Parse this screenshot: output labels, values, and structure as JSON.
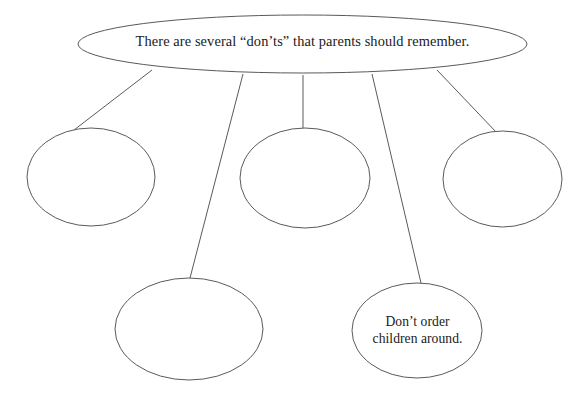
{
  "diagram": {
    "type": "web-graphic-organizer",
    "title_node": {
      "id": "main-idea",
      "text": "There are several “don’ts” that parents should remember.",
      "shape": "ellipse",
      "cx": 302.5,
      "cy": 44,
      "rx": 224.5,
      "ry": 29
    },
    "detail_nodes": [
      {
        "id": "detail-1",
        "label": "",
        "shape": "ellipse",
        "cx": 91,
        "cy": 177,
        "rx": 64,
        "ry": 49,
        "empty": true
      },
      {
        "id": "detail-2",
        "label": "",
        "shape": "ellipse",
        "cx": 189,
        "cy": 329,
        "rx": 74,
        "ry": 51,
        "empty": true
      },
      {
        "id": "detail-3",
        "label": "",
        "shape": "ellipse",
        "cx": 305,
        "cy": 178,
        "rx": 65,
        "ry": 50,
        "empty": true
      },
      {
        "id": "detail-4",
        "label": "Don’t order\nchildren around.",
        "shape": "ellipse",
        "cx": 417,
        "cy": 330.5,
        "rx": 65,
        "ry": 47.5,
        "empty": false
      },
      {
        "id": "detail-5",
        "label": "",
        "shape": "ellipse",
        "cx": 502.5,
        "cy": 179,
        "rx": 59.5,
        "ry": 48,
        "empty": true
      }
    ],
    "connectors": [
      {
        "id": "connector-1",
        "from": "main-idea",
        "to": "detail-1",
        "x1": 152,
        "y1": 70,
        "x2": 74,
        "y2": 130
      },
      {
        "id": "connector-2",
        "from": "main-idea",
        "to": "detail-2",
        "x1": 243,
        "y1": 74,
        "x2": 190,
        "y2": 278
      },
      {
        "id": "connector-3",
        "from": "main-idea",
        "to": "detail-3",
        "x1": 303,
        "y1": 75,
        "x2": 303,
        "y2": 129
      },
      {
        "id": "connector-4",
        "from": "main-idea",
        "to": "detail-4",
        "x1": 372,
        "y1": 74,
        "x2": 421,
        "y2": 283
      },
      {
        "id": "connector-5",
        "from": "main-idea",
        "to": "detail-5",
        "x1": 437,
        "y1": 70,
        "x2": 497,
        "y2": 133
      }
    ],
    "style": {
      "stroke_color": "#5a5a5e",
      "stroke_width": 1,
      "fill_color": "#ffffff",
      "text_color": "#1a1a1a",
      "background_color": "#ffffff"
    }
  }
}
